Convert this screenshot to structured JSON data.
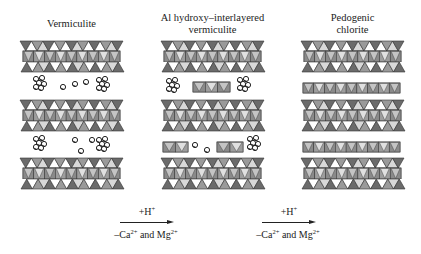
{
  "columns": [
    {
      "title_lines": [
        "Vermiculite"
      ],
      "x": 20,
      "width": 103
    },
    {
      "title_lines": [
        "Al hydroxy–interlayered",
        "vermiculite"
      ],
      "x": 161,
      "width": 103
    },
    {
      "title_lines": [
        "Pedogenic",
        "chlorite"
      ],
      "x": 301,
      "width": 103
    }
  ],
  "reactions": [
    {
      "top": "+H",
      "top_sup": "+",
      "bottom_pre": "–Ca",
      "bottom_sup1": "2+",
      "bottom_mid": " and Mg",
      "bottom_sup2": "2+"
    },
    {
      "top": "+H",
      "top_sup": "+",
      "bottom_pre": "–Ca",
      "bottom_sup1": "2+",
      "bottom_mid": " and Mg",
      "bottom_sup2": "2+"
    }
  ],
  "colors": {
    "dark_tetra": "#6b6b6b",
    "light_tetra": "#ffffff",
    "octa_dark": "#8a8a8a",
    "octa_light": "#c4c4c4",
    "outline": "#333333"
  },
  "legend_semantics": {
    "tot_layer": "2:1 silicate layer (tetrahedral-octahedral-tetrahedral)",
    "circles": "hydrated exchangeable cations",
    "hydroxy_sheet": "Al hydroxy interlayer"
  }
}
